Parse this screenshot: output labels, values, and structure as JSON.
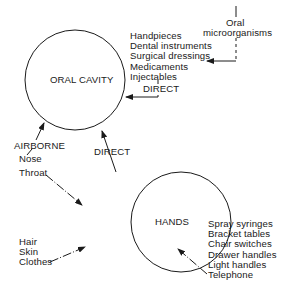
{
  "nodes": {
    "oral_cavity": {
      "label": "ORAL CAVITY"
    },
    "hands": {
      "label": "HANDS"
    }
  },
  "source": {
    "oral_microorganisms": [
      "Oral",
      "microorganisms"
    ]
  },
  "instruments": {
    "items": [
      "Handpieces",
      "Dental instruments",
      "Surgical dressings",
      "Medicaments",
      "Injectables"
    ],
    "route": "DIRECT"
  },
  "airborne": {
    "route": "AIRBORNE",
    "items": [
      "Nose",
      "Throat"
    ]
  },
  "hands_to_oral": {
    "route": "DIRECT"
  },
  "body_sources": {
    "items": [
      "Hair",
      "Skin",
      "Clothes"
    ]
  },
  "equipment": {
    "items": [
      "Spray syringes",
      "Bracket tables",
      "Chair switches",
      "Drawer handles",
      "Light handles",
      "Telephone"
    ]
  },
  "colors": {
    "line": "#1a1a1a",
    "background": "#ffffff"
  }
}
